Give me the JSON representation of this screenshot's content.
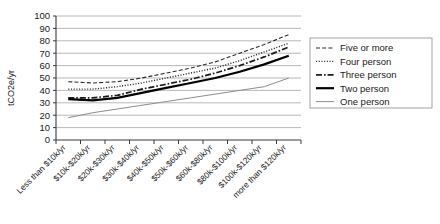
{
  "chart_data": {
    "type": "line",
    "title": "",
    "xlabel": "",
    "ylabel": "tCO2e/yr",
    "ylim": [
      0,
      100
    ],
    "ytick_step": 10,
    "grid": true,
    "legend_position": "right",
    "categories": [
      "Less than $10k/yr",
      "$10k-$20k/yr",
      "$20k-$30k/yr",
      "$30k-$40k/yr",
      "$40k-$50k/yr",
      "$50k-$60k/yr",
      "$60k-$80k/yr",
      "$80k-$100k/yr",
      "$100k-$120k/yr",
      "more than $120k/yr"
    ],
    "yticks": [
      "0",
      "10",
      "20",
      "30",
      "40",
      "50",
      "60",
      "70",
      "80",
      "90",
      "100"
    ],
    "series": [
      {
        "name": "Five or more",
        "style": "dashed",
        "color": "#2b2b2b",
        "values": [
          47,
          46,
          47,
          50,
          54,
          58,
          63,
          70,
          77,
          85
        ]
      },
      {
        "name": "Four person",
        "style": "dotted",
        "color": "#2b2b2b",
        "values": [
          41,
          41,
          43,
          46,
          50,
          54,
          58,
          64,
          71,
          78
        ]
      },
      {
        "name": "Three person",
        "style": "dash-dot",
        "color": "#1a1a1a",
        "values": [
          34,
          34,
          36,
          41,
          45,
          49,
          54,
          60,
          67,
          75
        ]
      },
      {
        "name": "Two person",
        "style": "solid-bold",
        "color": "#000000",
        "values": [
          33,
          32,
          34,
          38,
          42,
          46,
          50,
          55,
          61,
          68
        ]
      },
      {
        "name": "One person",
        "style": "solid-thin",
        "color": "#8c8c8c",
        "values": [
          18,
          22,
          25,
          28,
          31,
          34,
          37,
          40,
          43,
          50
        ]
      }
    ]
  },
  "legend": {
    "items": [
      {
        "label": "Five or more"
      },
      {
        "label": "Four person"
      },
      {
        "label": "Three person"
      },
      {
        "label": "Two person"
      },
      {
        "label": "One person"
      }
    ]
  }
}
